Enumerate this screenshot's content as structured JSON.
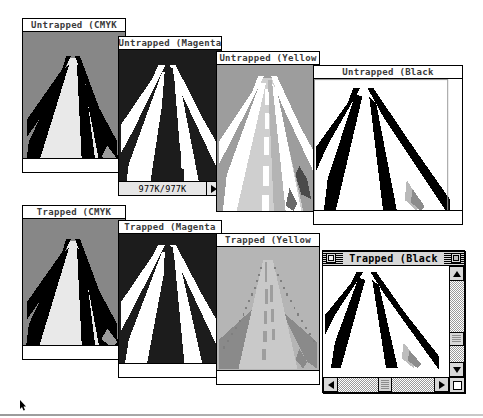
{
  "screen": {
    "width": 483,
    "height": 418,
    "background": "#ffffff",
    "bottom_rule": true
  },
  "windows": [
    {
      "id": "untrapped-cmyk",
      "title": "Untrapped (CMYK",
      "channel": "cmyk",
      "state": "inactive",
      "row": "untrapped",
      "x": 22,
      "y": 18,
      "w": 104,
      "h": 155,
      "title_w": 104,
      "has_status_bar": false,
      "has_gutter": true
    },
    {
      "id": "untrapped-magenta",
      "title": "Untrapped (Magenta",
      "channel": "magenta",
      "state": "inactive",
      "row": "untrapped",
      "x": 118,
      "y": 36,
      "w": 104,
      "h": 160,
      "title_w": 104,
      "has_status_bar": true,
      "status_text": "977K/977K",
      "status_popup_icon": "triangle-right-icon",
      "has_gutter": false
    },
    {
      "id": "untrapped-yellow",
      "title": "Untrapped (Yellow",
      "channel": "yellow",
      "state": "inactive",
      "row": "untrapped",
      "x": 216,
      "y": 51,
      "w": 104,
      "h": 161,
      "title_w": 104,
      "has_status_bar": false,
      "has_gutter": false
    },
    {
      "id": "untrapped-black",
      "title": "Untrapped (Black",
      "channel": "black",
      "state": "inactive",
      "row": "untrapped",
      "x": 313,
      "y": 65,
      "w": 150,
      "h": 160,
      "title_w": 150,
      "has_status_bar": false,
      "has_gutter": true,
      "has_side_gutter": true
    },
    {
      "id": "trapped-cmyk",
      "title": "Trapped (CMYK",
      "channel": "cmyk",
      "state": "inactive",
      "row": "trapped",
      "x": 22,
      "y": 205,
      "w": 104,
      "h": 155,
      "title_w": 104,
      "has_status_bar": false,
      "has_gutter": true
    },
    {
      "id": "trapped-magenta",
      "title": "Trapped (Magenta",
      "channel": "magenta",
      "state": "inactive",
      "row": "trapped",
      "x": 118,
      "y": 220,
      "w": 104,
      "h": 158,
      "title_w": 104,
      "has_status_bar": false,
      "has_gutter": true
    },
    {
      "id": "trapped-yellow",
      "title": "Trapped (Yellow",
      "channel": "yellow-trapped",
      "state": "inactive",
      "row": "trapped",
      "x": 216,
      "y": 233,
      "w": 104,
      "h": 152,
      "title_w": 104,
      "has_status_bar": false,
      "has_gutter": true
    },
    {
      "id": "trapped-black",
      "title": "Trapped (Black",
      "channel": "black",
      "state": "active",
      "row": "trapped",
      "x": 322,
      "y": 250,
      "w": 143,
      "h": 143,
      "title_w": 143,
      "close_box": "close-box-icon",
      "zoom_box": "zoom-box-icon",
      "scrollbars": {
        "vertical": {
          "up_arrow": "scroll-up-arrow-icon",
          "down_arrow": "scroll-down-arrow-icon",
          "thumb_position_pct": 62
        },
        "horizontal": {
          "left_arrow": "scroll-left-arrow-icon",
          "right_arrow": "scroll-right-arrow-icon",
          "thumb_position_pct": 52
        },
        "grow_box": "grow-box-icon"
      }
    }
  ],
  "cursor": {
    "name": "arrow-cursor",
    "x": 20,
    "y": 396
  }
}
